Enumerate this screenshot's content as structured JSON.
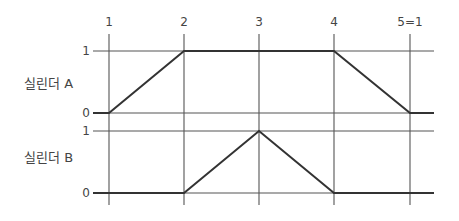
{
  "diagram": {
    "type": "displacement-step diagram",
    "steps": [
      "1",
      "2",
      "3",
      "4",
      "5=1"
    ],
    "rows": [
      {
        "label": "실린더 A",
        "levels": {
          "high": "1",
          "low": "0"
        },
        "values": [
          0,
          1,
          1,
          1,
          0
        ]
      },
      {
        "label": "실린더 B",
        "levels": {
          "high": "1",
          "low": "0"
        },
        "values": [
          0,
          0,
          1,
          0,
          0
        ]
      }
    ]
  }
}
